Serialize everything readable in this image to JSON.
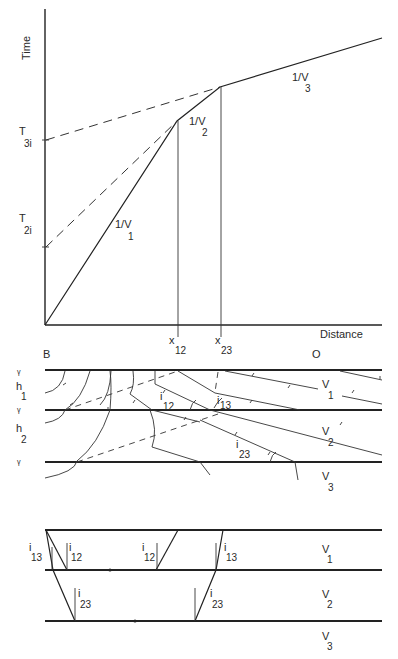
{
  "travel_time_plot": {
    "y_axis_label": "Time",
    "x_axis_label": "Distance",
    "intercepts": [
      {
        "main": "T",
        "sub": "3i"
      },
      {
        "main": "T",
        "sub": "2i"
      }
    ],
    "slopes": [
      {
        "main": "1/V",
        "sub": "1"
      },
      {
        "main": "1/V",
        "sub": "2"
      },
      {
        "main": "1/V",
        "sub": "3"
      }
    ],
    "crossovers": [
      {
        "main": "x",
        "sub": "12"
      },
      {
        "main": "x",
        "sub": "23"
      }
    ]
  },
  "wavefront_diagram": {
    "source_label": "B",
    "end_label": "O",
    "thicknesses": [
      {
        "main": "h",
        "sub": "1"
      },
      {
        "main": "h",
        "sub": "2"
      }
    ],
    "velocities": [
      {
        "main": "V",
        "sub": "1"
      },
      {
        "main": "V",
        "sub": "2"
      },
      {
        "main": "V",
        "sub": "3"
      }
    ],
    "angles": [
      {
        "main": "i",
        "sub": "12"
      },
      {
        "main": "i",
        "sub": "13"
      },
      {
        "main": "i",
        "sub": "23"
      }
    ]
  },
  "ray_angle_diagram": {
    "angles_left": [
      {
        "main": "i",
        "sub": "13"
      },
      {
        "main": "i",
        "sub": "12"
      },
      {
        "main": "i",
        "sub": "23"
      }
    ],
    "angles_mid": [
      {
        "main": "i",
        "sub": "12"
      }
    ],
    "angles_right": [
      {
        "main": "i",
        "sub": "13"
      },
      {
        "main": "i",
        "sub": "23"
      }
    ],
    "velocities": [
      {
        "main": "V",
        "sub": "1"
      },
      {
        "main": "V",
        "sub": "2"
      },
      {
        "main": "V",
        "sub": "3"
      }
    ]
  }
}
